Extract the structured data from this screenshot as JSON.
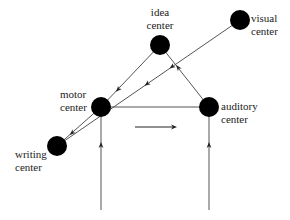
{
  "nodes": {
    "idea": {
      "line1": "idea",
      "line2": "center"
    },
    "visual": {
      "line1": "visual",
      "line2": "center"
    },
    "motor": {
      "line1": "motor",
      "line2": "center"
    },
    "auditory": {
      "line1": "auditory",
      "line2": "center"
    },
    "writing": {
      "line1": "writing",
      "line2": "center"
    }
  },
  "colors": {
    "node": "#000000",
    "line": "#555555",
    "text": "#222222"
  }
}
